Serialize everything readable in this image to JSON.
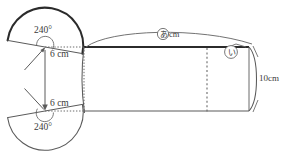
{
  "figure": {
    "name": "cylinder-with-two-sector-fans",
    "stroke_color": "#4a4a4a",
    "thick_stroke_color": "#2b2b2b",
    "background_color": "#ffffff"
  },
  "labels": {
    "top_sector_angle": "240°",
    "bottom_sector_angle": "240°",
    "top_radius": "6 cm",
    "bottom_radius": "6 cm",
    "height": "10cm",
    "arc_length_label": "cm",
    "arc_label_symbol": "あ",
    "depth_label_symbol": "い"
  },
  "geometry": {
    "top_circle": {
      "cx": 45,
      "cy": 47,
      "r": 38
    },
    "bottom_circle": {
      "cx": 45,
      "cy": 111,
      "r": 38
    },
    "body_left_x": 84,
    "body_right_x": 252,
    "body_top_y": 47,
    "body_bottom_y": 111,
    "dotted_line_x": 207,
    "sector_angle_deg": 240
  }
}
